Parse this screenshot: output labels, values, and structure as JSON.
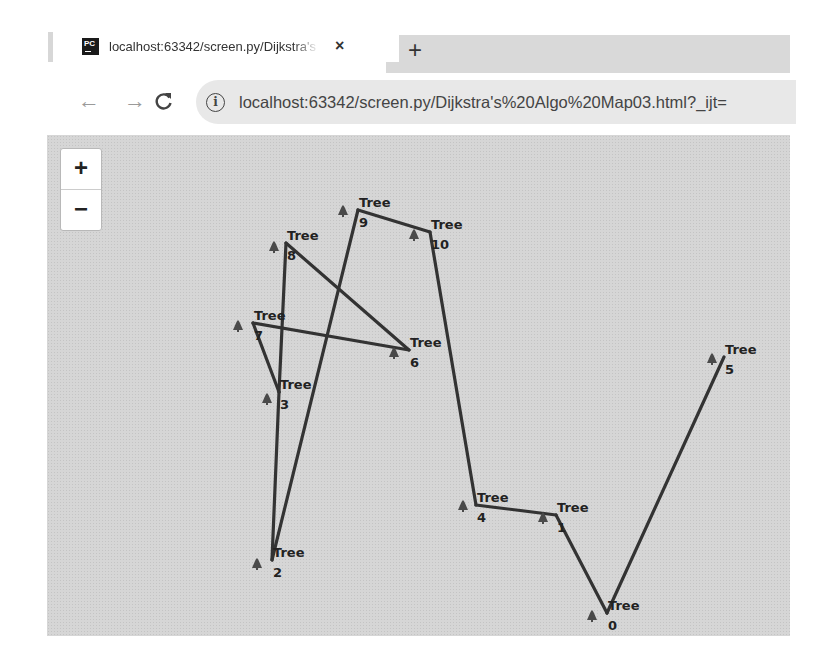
{
  "browser": {
    "tab": {
      "favicon_text": "PC",
      "title": "localhost:63342/screen.py/Dijkstra's Algo Map03.html",
      "close_label": "×"
    },
    "new_tab_label": "+",
    "nav": {
      "back_icon": "←",
      "forward_icon": "→",
      "reload_icon": "C"
    },
    "address_bar": {
      "info_icon": "i",
      "url": "localhost:63342/screen.py/Dijkstra's%20Algo%20Map03.html?_ijt="
    }
  },
  "map": {
    "zoom_in_label": "+",
    "zoom_out_label": "−",
    "background_color": "#d6d6d6",
    "edge_color": "#333333",
    "marker_color": "#4a4a4a",
    "nodes": [
      {
        "id": "0",
        "label": "Tree",
        "x": 560,
        "y": 478,
        "mx": 545,
        "my": 482
      },
      {
        "id": "1",
        "label": "Tree",
        "x": 509,
        "y": 380,
        "mx": 496,
        "my": 384
      },
      {
        "id": "2",
        "label": "Tree",
        "x": 225,
        "y": 425,
        "mx": 210,
        "my": 430
      },
      {
        "id": "3",
        "label": "Tree",
        "x": 232,
        "y": 257,
        "mx": 220,
        "my": 265
      },
      {
        "id": "4",
        "label": "Tree",
        "x": 429,
        "y": 370,
        "mx": 416,
        "my": 372
      },
      {
        "id": "5",
        "label": "Tree",
        "x": 677,
        "y": 222,
        "mx": 665,
        "my": 225
      },
      {
        "id": "6",
        "label": "Tree",
        "x": 362,
        "y": 215,
        "mx": 347,
        "my": 219
      },
      {
        "id": "7",
        "label": "Tree",
        "x": 206,
        "y": 188,
        "mx": 191,
        "my": 192
      },
      {
        "id": "8",
        "label": "Tree",
        "x": 239,
        "y": 108,
        "mx": 227,
        "my": 113
      },
      {
        "id": "9",
        "label": "Tree",
        "x": 311,
        "y": 75,
        "mx": 296,
        "my": 77
      },
      {
        "id": "10",
        "label": "Tree",
        "x": 383,
        "y": 97,
        "mx": 367,
        "my": 101
      }
    ],
    "edges": [
      [
        "8",
        "6"
      ],
      [
        "6",
        "7"
      ],
      [
        "7",
        "3"
      ],
      [
        "8",
        "3"
      ],
      [
        "3",
        "2"
      ],
      [
        "2",
        "9"
      ],
      [
        "9",
        "10"
      ],
      [
        "10",
        "4"
      ],
      [
        "4",
        "1"
      ],
      [
        "1",
        "0"
      ],
      [
        "0",
        "5"
      ]
    ]
  }
}
